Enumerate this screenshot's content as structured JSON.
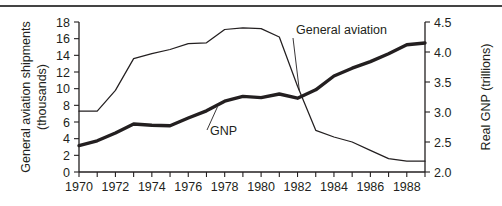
{
  "chart_data": {
    "type": "line",
    "title": "",
    "subtitle": "",
    "xlabel": "",
    "ylabel": "General aviation shipments (thousands)",
    "y2label": "Real GNP (trillions)",
    "grid": false,
    "legend_position": "inline-annotations",
    "xlim": [
      1970,
      1989
    ],
    "ylim": [
      0,
      18
    ],
    "y2lim": [
      2.0,
      4.5
    ],
    "x_tick_step": 1,
    "x_labeled_step": 2,
    "x": [
      1970,
      1971,
      1972,
      1973,
      1974,
      1975,
      1976,
      1977,
      1978,
      1979,
      1980,
      1981,
      1982,
      1983,
      1984,
      1985,
      1986,
      1987,
      1988,
      1989
    ],
    "xticklabels": [
      "1970",
      "",
      "1972",
      "",
      "1974",
      "",
      "1976",
      "",
      "1978",
      "",
      "1980",
      "",
      "1982",
      "",
      "1984",
      "",
      "1986",
      "",
      "1988",
      ""
    ],
    "yticks": [
      0,
      2,
      4,
      6,
      8,
      10,
      12,
      14,
      16,
      18
    ],
    "yticklabels": [
      "0",
      "2",
      "4",
      "6",
      "8",
      "10",
      "12",
      "14",
      "16",
      "18"
    ],
    "y2ticks": [
      2.0,
      2.5,
      3.0,
      3.5,
      4.0,
      4.5
    ],
    "y2ticklabels": [
      "2.0",
      "2.5",
      "3.0",
      "3.5",
      "4.0",
      "4.5"
    ],
    "series": [
      {
        "name": "General aviation",
        "axis": "left",
        "style": "thin",
        "units": "thousands of shipments",
        "values": [
          7.3,
          7.3,
          9.8,
          13.6,
          14.2,
          14.7,
          15.4,
          15.5,
          17.1,
          17.3,
          17.2,
          16.2,
          10.3,
          5.0,
          4.2,
          3.6,
          2.6,
          1.6,
          1.3,
          1.3
        ]
      },
      {
        "name": "GNP",
        "axis": "right",
        "style": "thick",
        "units": "trillions of dollars (real)",
        "values": [
          2.44,
          2.52,
          2.65,
          2.8,
          2.78,
          2.77,
          2.9,
          3.02,
          3.18,
          3.26,
          3.24,
          3.3,
          3.23,
          3.37,
          3.6,
          3.73,
          3.84,
          3.97,
          4.12,
          4.15
        ]
      }
    ],
    "annotations": [
      {
        "text": "General aviation",
        "x": 1982.1,
        "y_axis": "left",
        "leader": true
      },
      {
        "text": "GNP",
        "x": 1977.6,
        "y_axis": "right",
        "leader": true
      }
    ]
  }
}
